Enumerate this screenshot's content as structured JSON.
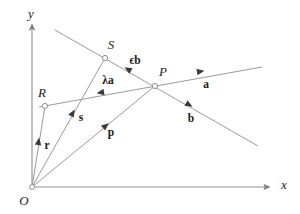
{
  "figure": {
    "background_color": "#ffffff",
    "stroke_color": "#8f8f8f",
    "text_color": "#1a1a1a"
  },
  "axes": {
    "x_label": "x",
    "y_label": "y",
    "origin_label": "O",
    "origin": {
      "x": 32,
      "y": 187
    },
    "x_axis_end": {
      "x": 272,
      "y": 187
    },
    "y_axis_end": {
      "x": 32,
      "y": 22
    }
  },
  "points": [
    {
      "name": "R",
      "label": "R",
      "x": 45,
      "y": 106,
      "label_x": 42,
      "label_y": 92
    },
    {
      "name": "S",
      "label": "S",
      "x": 105,
      "y": 58,
      "label_x": 111,
      "label_y": 44
    },
    {
      "name": "P",
      "label": "P",
      "x": 155,
      "y": 86,
      "label_x": 163,
      "label_y": 71
    },
    {
      "name": "O",
      "label": "O",
      "x": 32,
      "y": 187,
      "label_x": 24,
      "label_y": 200
    }
  ],
  "lines": [
    {
      "name": "line-through-R-and-P-direction-a",
      "from_x": 39,
      "from_y": 107,
      "to_x": 262,
      "to_y": 67
    },
    {
      "name": "line-through-S-and-P-direction-b",
      "from_x": 55,
      "from_y": 30,
      "to_x": 258,
      "to_y": 146
    },
    {
      "name": "position-vector-r-O-to-R",
      "from_x": 32,
      "from_y": 187,
      "to_x": 45,
      "to_y": 106
    },
    {
      "name": "position-vector-s-O-to-S",
      "from_x": 32,
      "from_y": 187,
      "to_x": 105,
      "to_y": 58
    },
    {
      "name": "position-vector-p-O-to-P",
      "from_x": 32,
      "from_y": 187,
      "to_x": 155,
      "to_y": 86
    }
  ],
  "vector_labels": [
    {
      "name": "vector-a-label",
      "text": "a",
      "x": 206,
      "y": 85
    },
    {
      "name": "vector-b-label",
      "text": "b",
      "x": 191,
      "y": 119
    },
    {
      "name": "vector-lambda-a-label",
      "text": "λa",
      "greek": "λ",
      "bold": "a",
      "x": 108,
      "y": 81
    },
    {
      "name": "vector-epsilon-b-label",
      "text": "ϵb",
      "greek": "ϵ",
      "bold": "b",
      "x": 135,
      "y": 61
    },
    {
      "name": "vector-r-label",
      "text": "r",
      "x": 47,
      "y": 146
    },
    {
      "name": "vector-s-label",
      "text": "s",
      "x": 81,
      "y": 118
    },
    {
      "name": "vector-p-label",
      "text": "p",
      "x": 111,
      "y": 133
    }
  ],
  "arrowheads": [
    {
      "name": "arrowhead-a",
      "x": 196,
      "y": 72,
      "angle_deg": -10
    },
    {
      "name": "arrowhead-b",
      "x": 188,
      "y": 105,
      "angle_deg": 30
    },
    {
      "name": "arrowhead-lambda-a",
      "x": 104,
      "y": 92,
      "angle_deg": 170
    },
    {
      "name": "arrowhead-epsilon-b",
      "x": 129,
      "y": 70,
      "angle_deg": 210
    },
    {
      "name": "arrowhead-r",
      "x": 38,
      "y": 143,
      "angle_deg": -81
    },
    {
      "name": "arrowhead-s",
      "x": 72,
      "y": 115,
      "angle_deg": -60
    },
    {
      "name": "arrowhead-p",
      "x": 104,
      "y": 127,
      "angle_deg": -39
    }
  ]
}
